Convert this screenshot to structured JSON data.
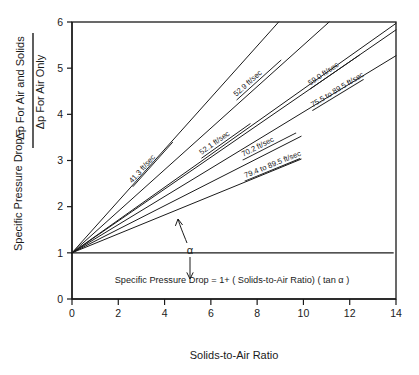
{
  "chart_data": {
    "type": "line",
    "title": "",
    "xlabel": "Solids-to-Air Ratio",
    "ylabel_parts": {
      "prefix": "Specific Pressure Drop =",
      "numerator": "Δp For Air and Solids",
      "denominator": "Δp  For Air Only"
    },
    "xlim": [
      0,
      14
    ],
    "ylim": [
      0,
      6
    ],
    "xticks": [
      0,
      2,
      4,
      6,
      8,
      10,
      12,
      14
    ],
    "yticks": [
      0,
      1,
      2,
      3,
      4,
      5,
      6
    ],
    "xtick_labels": [
      "0",
      "2",
      "4",
      "6",
      "8",
      "10",
      "12",
      "14"
    ],
    "ytick_labels": [
      "0",
      "1",
      "2",
      "3",
      "4",
      "5",
      "6"
    ],
    "grid": false,
    "legend_position": "inline-along-lines",
    "common_origin": [
      0,
      1
    ],
    "reference_line": {
      "y": 1,
      "x_start": 0,
      "x_end": 13.9
    },
    "annotation_equation": "Specific Pressure Drop = 1+ ( Solids-to-Air Ratio) ( tan α )",
    "annotation_angle": "α",
    "series": [
      {
        "name": "41.3 ft/sec",
        "label": "41.3 ft/sec",
        "slope": 0.56,
        "x_end": 9.0,
        "label_x": 2.6,
        "label_y": 2.5
      },
      {
        "name": "52.9 ft/sec",
        "label": "52.9 ft/sec",
        "slope": 0.45,
        "x_end": 11.2,
        "label_x": 7.1,
        "label_y": 4.38
      },
      {
        "name": "52.1 ft/sec",
        "label": "52.1 ft/sec",
        "slope": 0.355,
        "x_end": 14.0,
        "label_x": 5.6,
        "label_y": 3.12
      },
      {
        "name": "59.0 ft/sec",
        "label": "59.0 ft/sec",
        "slope": 0.345,
        "x_end": 14.0,
        "label_x": 10.3,
        "label_y": 4.62
      },
      {
        "name": "70.2 ft/sec",
        "label": "70.2 ft/sec",
        "slope": 0.255,
        "x_end": 9.9,
        "label_x": 7.4,
        "label_y": 3.08
      },
      {
        "name": "75.5 to 89.5 ft/sec",
        "label": "75.5 to 89.5 ft/sec",
        "slope": 0.305,
        "x_end": 14.0,
        "label_x": 10.4,
        "label_y": 4.15
      },
      {
        "name": "79.4 to 89.5 ft/sec",
        "label": "79.4 to 89.5 ft/sec",
        "slope": 0.205,
        "x_end": 9.9,
        "label_x": 7.5,
        "label_y": 2.62
      }
    ]
  },
  "colors": {
    "ink": "#1a1a1a",
    "background": "#ffffff"
  }
}
